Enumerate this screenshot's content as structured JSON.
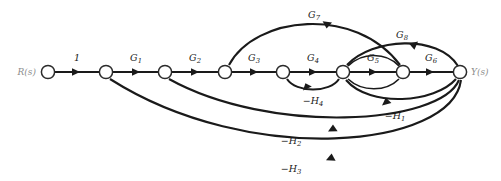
{
  "diagram": {
    "type": "signal-flow-graph",
    "title": "",
    "input_label": "R(s)",
    "output_label": "Y(s)",
    "node_count": 8,
    "nodes": [
      {
        "id": "n0",
        "label": "R(s)",
        "x": 48,
        "y": 72
      },
      {
        "id": "n1",
        "label": "",
        "x": 106,
        "y": 72
      },
      {
        "id": "n2",
        "label": "",
        "x": 165,
        "y": 72
      },
      {
        "id": "n3",
        "label": "",
        "x": 225,
        "y": 72
      },
      {
        "id": "n4",
        "label": "",
        "x": 283,
        "y": 72
      },
      {
        "id": "n5",
        "label": "",
        "x": 343,
        "y": 72
      },
      {
        "id": "n6",
        "label": "",
        "x": 403,
        "y": 72
      },
      {
        "id": "n7",
        "label": "Y(s)",
        "x": 460,
        "y": 72
      }
    ],
    "forward_edges": [
      {
        "label": "1",
        "base": "1",
        "sub": "",
        "from": "n0",
        "to": "n1",
        "label_x": 77,
        "label_y": 61
      },
      {
        "label": "G1",
        "base": "G",
        "sub": "1",
        "from": "n1",
        "to": "n2",
        "label_x": 136,
        "label_y": 61
      },
      {
        "label": "G2",
        "base": "G",
        "sub": "2",
        "from": "n2",
        "to": "n3",
        "label_x": 195,
        "label_y": 61
      },
      {
        "label": "G3",
        "base": "G",
        "sub": "3",
        "from": "n3",
        "to": "n4",
        "label_x": 254,
        "label_y": 61
      },
      {
        "label": "G4",
        "base": "G",
        "sub": "4",
        "from": "n4",
        "to": "n5",
        "label_x": 313,
        "label_y": 61
      },
      {
        "label": "G5",
        "base": "G",
        "sub": "5",
        "from": "n5",
        "to": "n6",
        "label_x": 373,
        "label_y": 61
      },
      {
        "label": "G6",
        "base": "G",
        "sub": "6",
        "from": "n6",
        "to": "n7",
        "label_x": 431,
        "label_y": 61
      }
    ],
    "feedforward_edges": [
      {
        "label": "G7",
        "base": "G",
        "sub": "7",
        "from": "n3",
        "to": "n6",
        "label_x": 314,
        "label_y": 18
      },
      {
        "label": "G8",
        "base": "G",
        "sub": "8",
        "from": "n5",
        "to": "n7",
        "label_x": 402,
        "label_y": 38
      }
    ],
    "feedback_edges": [
      {
        "label": "-H4",
        "base": "−H",
        "sub": "4",
        "from": "n5",
        "to": "n4",
        "label_x": 313,
        "label_y": 102
      },
      {
        "label": "-H1",
        "base": "−H",
        "sub": "1",
        "from": "n7",
        "to": "n5",
        "label_x": 395,
        "label_y": 117
      },
      {
        "label": "-H2",
        "base": "−H",
        "sub": "2",
        "from": "n7",
        "to": "n2",
        "label_x": 291,
        "label_y": 142
      },
      {
        "label": "-H3",
        "base": "−H",
        "sub": "3",
        "from": "n7",
        "to": "n1",
        "label_x": 291,
        "label_y": 170
      }
    ],
    "colors": {
      "stroke": "#1a1a1a",
      "node_fill": "#ffffff",
      "node_stroke": "#2b2b2b",
      "io_label": "#8d8d8d",
      "background": "#ffffff"
    }
  }
}
